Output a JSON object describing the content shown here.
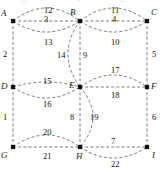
{
  "figure": {
    "type": "graph-diagram",
    "title": "",
    "background": "#ffffff",
    "edge_color": "#555555",
    "node_color": "#111111",
    "label_color": "#111111",
    "width": 164,
    "height": 172
  },
  "nodes": [
    {
      "id": "A",
      "label": "A",
      "x": 13,
      "y": 21,
      "label_dx": -12,
      "label_dy": -12
    },
    {
      "id": "B",
      "label": "B",
      "x": 80,
      "y": 21,
      "label_dx": -10,
      "label_dy": -13
    },
    {
      "id": "C",
      "label": "C",
      "x": 147,
      "y": 21,
      "label_dx": 4,
      "label_dy": -13
    },
    {
      "id": "D",
      "label": "D",
      "x": 13,
      "y": 87,
      "label_dx": -12,
      "label_dy": -5
    },
    {
      "id": "E",
      "label": "E",
      "x": 80,
      "y": 87,
      "label_dx": -11,
      "label_dy": -6
    },
    {
      "id": "F",
      "label": "F",
      "x": 147,
      "y": 87,
      "label_dx": 4,
      "label_dy": -5
    },
    {
      "id": "G",
      "label": "G",
      "x": 13,
      "y": 147,
      "label_dx": -12,
      "label_dy": 4
    },
    {
      "id": "H",
      "label": "H",
      "x": 80,
      "y": 147,
      "label_dx": -4,
      "label_dy": 5
    },
    {
      "id": "I",
      "label": "I",
      "x": 147,
      "y": 147,
      "label_dx": 5,
      "label_dy": 4
    }
  ],
  "edges": [
    {
      "id": "e12",
      "from": "A",
      "to": "B",
      "weight": "12",
      "curve": -13,
      "label_x": 44,
      "label_y": 6
    },
    {
      "id": "e3",
      "from": "A",
      "to": "B",
      "weight": "3",
      "curve": 0,
      "label_x": 44,
      "label_y": 15
    },
    {
      "id": "e13",
      "from": "A",
      "to": "B",
      "weight": "13",
      "curve": 11,
      "label_x": 44,
      "label_y": 38
    },
    {
      "id": "e11",
      "from": "B",
      "to": "C",
      "weight": "11",
      "curve": -13,
      "label_x": 111,
      "label_y": 6
    },
    {
      "id": "e4",
      "from": "B",
      "to": "C",
      "weight": "4",
      "curve": 0,
      "label_x": 112,
      "label_y": 15
    },
    {
      "id": "e10",
      "from": "B",
      "to": "C",
      "weight": "10",
      "curve": 11,
      "label_x": 111,
      "label_y": 38
    },
    {
      "id": "e2",
      "from": "A",
      "to": "D",
      "weight": "2",
      "curve": 0,
      "label_x": 3,
      "label_y": 50
    },
    {
      "id": "e5",
      "from": "C",
      "to": "F",
      "weight": "5",
      "curve": 0,
      "label_x": 152,
      "label_y": 50
    },
    {
      "id": "e14",
      "from": "B",
      "to": "E",
      "weight": "14",
      "curve": 12,
      "label_x": 57,
      "label_y": 51
    },
    {
      "id": "e9",
      "from": "B",
      "to": "E",
      "weight": "9",
      "curve": 0,
      "label_x": 83,
      "label_y": 51
    },
    {
      "id": "e15",
      "from": "D",
      "to": "E",
      "weight": "15",
      "curve": -5,
      "label_x": 43,
      "label_y": 77
    },
    {
      "id": "e16",
      "from": "D",
      "to": "E",
      "weight": "16",
      "curve": 11,
      "label_x": 43,
      "label_y": 100
    },
    {
      "id": "e17",
      "from": "E",
      "to": "F",
      "weight": "17",
      "curve": -12,
      "label_x": 111,
      "label_y": 66
    },
    {
      "id": "e18",
      "from": "E",
      "to": "F",
      "weight": "18",
      "curve": 0,
      "label_x": 111,
      "label_y": 91
    },
    {
      "id": "e1",
      "from": "D",
      "to": "G",
      "weight": "1",
      "curve": 0,
      "label_x": 3,
      "label_y": 113
    },
    {
      "id": "e6",
      "from": "F",
      "to": "I",
      "weight": "6",
      "curve": 0,
      "label_x": 152,
      "label_y": 113
    },
    {
      "id": "e8",
      "from": "E",
      "to": "H",
      "weight": "8",
      "curve": 0,
      "label_x": 70,
      "label_y": 113
    },
    {
      "id": "e19",
      "from": "E",
      "to": "H",
      "weight": "19",
      "curve": -13,
      "label_x": 90,
      "label_y": 113
    },
    {
      "id": "e20",
      "from": "G",
      "to": "H",
      "weight": "20",
      "curve": -12,
      "label_x": 43,
      "label_y": 128
    },
    {
      "id": "e21",
      "from": "G",
      "to": "H",
      "weight": "21",
      "curve": 0,
      "label_x": 43,
      "label_y": 152
    },
    {
      "id": "e7",
      "from": "H",
      "to": "I",
      "weight": "7",
      "curve": 0,
      "label_x": 111,
      "label_y": 137
    },
    {
      "id": "e22",
      "from": "H",
      "to": "I",
      "weight": "22",
      "curve": 11,
      "label_x": 111,
      "label_y": 160
    }
  ]
}
